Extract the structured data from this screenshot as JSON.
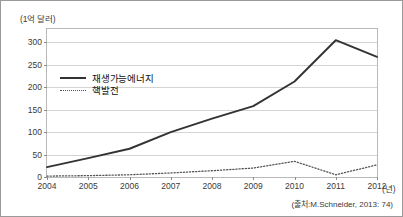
{
  "figure": {
    "unit_label": "(1억 달러)",
    "xaxis_unit": "(년)",
    "source_note": "(출처:M.Schneider, 2013: 74)"
  },
  "legend": {
    "items": [
      {
        "label": "재생가능에너지",
        "style": "solid",
        "color": "#333333"
      },
      {
        "label": "핵발전",
        "style": "dotted",
        "color": "#555555"
      }
    ]
  },
  "chart_data": {
    "type": "line",
    "title": "",
    "xlabel": "(년)",
    "ylabel": "(1억 달러)",
    "x": [
      2004,
      2005,
      2006,
      2007,
      2008,
      2009,
      2010,
      2011,
      2012
    ],
    "categories": [
      "2004",
      "2005",
      "2006",
      "2007",
      "2008",
      "2009",
      "2010",
      "2011",
      "2012"
    ],
    "series": [
      {
        "name": "재생가능에너지",
        "style": "solid",
        "color": "#333333",
        "values": [
          22,
          42,
          63,
          100,
          130,
          158,
          213,
          305,
          268
        ]
      },
      {
        "name": "핵발전",
        "style": "dotted",
        "color": "#555555",
        "values": [
          2,
          3,
          5,
          9,
          14,
          20,
          35,
          5,
          27
        ]
      }
    ],
    "ylim": [
      0,
      330
    ],
    "yticks": [
      0,
      50,
      100,
      150,
      200,
      250,
      300
    ],
    "ytick_labels": [
      "0",
      "50",
      "100",
      "150",
      "200",
      "250",
      "300"
    ],
    "xlim": [
      2004,
      2012
    ],
    "grid": true,
    "grid_axis": "y",
    "legend_position": "inside-upper-left"
  }
}
